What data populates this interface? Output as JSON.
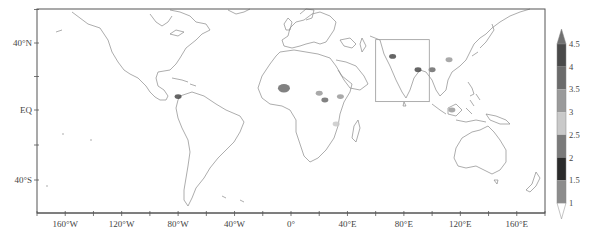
{
  "map": {
    "projection": "equirectangular",
    "frame": {
      "left": 37,
      "top": 9,
      "right": 545,
      "bottom": 213
    },
    "lon_range": [
      -180,
      180
    ],
    "lat_range": [
      -60,
      85
    ],
    "coastline_color": "#8a8a8a",
    "frame_color": "#555555",
    "x_ticks": [
      {
        "lon": -160,
        "label": "160°W"
      },
      {
        "lon": -120,
        "label": "120°W"
      },
      {
        "lon": -80,
        "label": "80°W"
      },
      {
        "lon": -40,
        "label": "40°W"
      },
      {
        "lon": 0,
        "label": "0°"
      },
      {
        "lon": 40,
        "label": "40°E"
      },
      {
        "lon": 80,
        "label": "80°E"
      },
      {
        "lon": 120,
        "label": "120°E"
      },
      {
        "lon": 160,
        "label": "160°E"
      }
    ],
    "y_ticks": [
      {
        "lat": 40,
        "label": "40°N"
      },
      {
        "lat": 0,
        "label": "EQ"
      },
      {
        "lat": -40,
        "label": "40°S"
      }
    ],
    "region_box": {
      "lon_min": 60,
      "lon_max": 98,
      "lat_min": 5,
      "lat_max": 42,
      "color": "#999999"
    },
    "shaded_regions": [
      {
        "name": "west-africa-sahel",
        "lon": -5,
        "lat": 13,
        "level": 3.5
      },
      {
        "name": "central-africa-1",
        "lon": 20,
        "lat": 10,
        "level": 3
      },
      {
        "name": "central-africa-2",
        "lon": 24,
        "lat": 6,
        "level": 3.5
      },
      {
        "name": "east-africa",
        "lon": 35,
        "lat": 8,
        "level": 3
      },
      {
        "name": "east-africa-rift",
        "lon": 32,
        "lat": -8,
        "level": 2.5
      },
      {
        "name": "pakistan-northwest-india",
        "lon": 72,
        "lat": 32,
        "level": 4
      },
      {
        "name": "bangladesh-northeast-india",
        "lon": 90,
        "lat": 24,
        "level": 4
      },
      {
        "name": "myanmar-yunnan",
        "lon": 100,
        "lat": 24,
        "level": 3.5
      },
      {
        "name": "south-china",
        "lon": 112,
        "lat": 30,
        "level": 3
      },
      {
        "name": "central-america",
        "lon": -80,
        "lat": 8,
        "level": 4
      },
      {
        "name": "borneo",
        "lon": 114,
        "lat": 0,
        "level": 3
      }
    ]
  },
  "colorbar": {
    "labels": [
      "1",
      "1.5",
      "2",
      "2.5",
      "3",
      "3.5",
      "4",
      "4.5"
    ],
    "segments": [
      {
        "from": 1.0,
        "to": 1.5,
        "color": "#8c8c8c"
      },
      {
        "from": 1.5,
        "to": 2.0,
        "color": "#2b2b2b"
      },
      {
        "from": 2.0,
        "to": 2.5,
        "color": "#7a7a7a"
      },
      {
        "from": 2.5,
        "to": 3.0,
        "color": "#c9c9c9"
      },
      {
        "from": 3.0,
        "to": 3.5,
        "color": "#9a9a9a"
      },
      {
        "from": 3.5,
        "to": 4.0,
        "color": "#6b6b6b"
      },
      {
        "from": 4.0,
        "to": 4.5,
        "color": "#4a4a4a"
      }
    ],
    "over_color": "#707070",
    "under_color": "#ffffff",
    "extend": "both"
  }
}
